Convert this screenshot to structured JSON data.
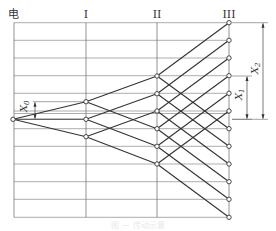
{
  "diagram": {
    "title": "",
    "column_labels": [
      {
        "id": "source",
        "label": "电",
        "x": 14
      },
      {
        "id": "I",
        "label": "I",
        "x": 86
      },
      {
        "id": "II",
        "label": "II",
        "x": 157
      },
      {
        "id": "III",
        "label": "III",
        "x": 229
      }
    ],
    "grid": {
      "x_start": 14,
      "x_end": 229,
      "rows_y": [
        22.7,
        40.3,
        58,
        75.7,
        93.3,
        111,
        128.7,
        146.3,
        164,
        181.7,
        199.3,
        217.3
      ],
      "extra_lines_y": [
        113.5
      ]
    },
    "nodes": {
      "source": [
        {
          "x": 13,
          "y": 119.3
        }
      ],
      "I": [
        {
          "x": 86,
          "y": 101.7
        },
        {
          "x": 86,
          "y": 119.3
        },
        {
          "x": 86,
          "y": 136.7
        }
      ],
      "II": [
        {
          "x": 157,
          "y": 76
        },
        {
          "x": 157,
          "y": 93.7
        },
        {
          "x": 157,
          "y": 111
        },
        {
          "x": 157,
          "y": 128.7
        },
        {
          "x": 157,
          "y": 146.3
        },
        {
          "x": 157,
          "y": 164
        }
      ],
      "III": [
        {
          "x": 229,
          "y": 22.7
        },
        {
          "x": 229,
          "y": 40.3
        },
        {
          "x": 229,
          "y": 58
        },
        {
          "x": 229,
          "y": 75.7
        },
        {
          "x": 229,
          "y": 93.3
        },
        {
          "x": 229,
          "y": 111
        },
        {
          "x": 229,
          "y": 128.7
        },
        {
          "x": 229,
          "y": 146.3
        },
        {
          "x": 229,
          "y": 164
        },
        {
          "x": 229,
          "y": 181.7
        },
        {
          "x": 229,
          "y": 199.3
        },
        {
          "x": 229,
          "y": 217.3
        }
      ]
    },
    "edges": [
      [
        "source",
        0,
        "I",
        0
      ],
      [
        "source",
        0,
        "I",
        1
      ],
      [
        "source",
        0,
        "I",
        2
      ],
      [
        "I",
        0,
        "II",
        0
      ],
      [
        "I",
        0,
        "II",
        3
      ],
      [
        "I",
        1,
        "II",
        1
      ],
      [
        "I",
        1,
        "II",
        4
      ],
      [
        "I",
        2,
        "II",
        2
      ],
      [
        "I",
        2,
        "II",
        5
      ],
      [
        "II",
        0,
        "III",
        0
      ],
      [
        "II",
        0,
        "III",
        6
      ],
      [
        "II",
        1,
        "III",
        1
      ],
      [
        "II",
        1,
        "III",
        7
      ],
      [
        "II",
        2,
        "III",
        2
      ],
      [
        "II",
        2,
        "III",
        8
      ],
      [
        "II",
        3,
        "III",
        3
      ],
      [
        "II",
        3,
        "III",
        9
      ],
      [
        "II",
        4,
        "III",
        4
      ],
      [
        "II",
        4,
        "III",
        10
      ],
      [
        "II",
        5,
        "III",
        5
      ],
      [
        "II",
        5,
        "III",
        11
      ]
    ],
    "dimensions": [
      {
        "id": "X0",
        "label": "X",
        "sub": "0",
        "x": 35,
        "y_top": 101.7,
        "y_bottom": 119.3,
        "ext_from_x": 33,
        "ext_to_x": 86,
        "label_x": 27,
        "label_y": 112
      },
      {
        "id": "X1",
        "label": "X",
        "sub": "1",
        "x": 247,
        "y_top": 76,
        "y_bottom": 119.3,
        "ext_from_x": 232,
        "ext_to_x": 252,
        "label_x": 242,
        "label_y": 100
      },
      {
        "id": "X2",
        "label": "X",
        "sub": "2",
        "x": 263,
        "y_top": 22.7,
        "y_bottom": 119.3,
        "ext_from_x": 232,
        "ext_to_x": 268,
        "label_x": 258,
        "label_y": 74
      }
    ],
    "caption": "图 — 传动示意"
  }
}
